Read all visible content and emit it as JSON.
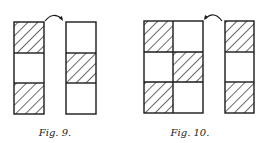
{
  "figures": [
    {
      "caption": "Fig. 9.",
      "description": "Two vertical 3-cell columns; left column has cells 1 and 3 hatched, right column has cell 2 hatched; curved arrow from left column to right column",
      "left_column": {
        "hatched": [
          true,
          false,
          true
        ]
      },
      "right_column": {
        "hatched": [
          false,
          true,
          false
        ]
      },
      "arrow": "left-to-right"
    },
    {
      "caption": "Fig. 10.",
      "description": "3x2 grid in checkerboard pattern next to a separate 3-cell column with cells 1 and 3 hatched; curved arrow from column to grid",
      "grid": {
        "rows": 3,
        "cols": 2,
        "hatched": [
          [
            true,
            false
          ],
          [
            false,
            true
          ],
          [
            true,
            false
          ]
        ]
      },
      "right_column": {
        "hatched": [
          true,
          false,
          true
        ]
      },
      "arrow": "right-to-left"
    }
  ],
  "colors": {
    "stroke": "#1a1a1a",
    "background": "#ffffff"
  }
}
